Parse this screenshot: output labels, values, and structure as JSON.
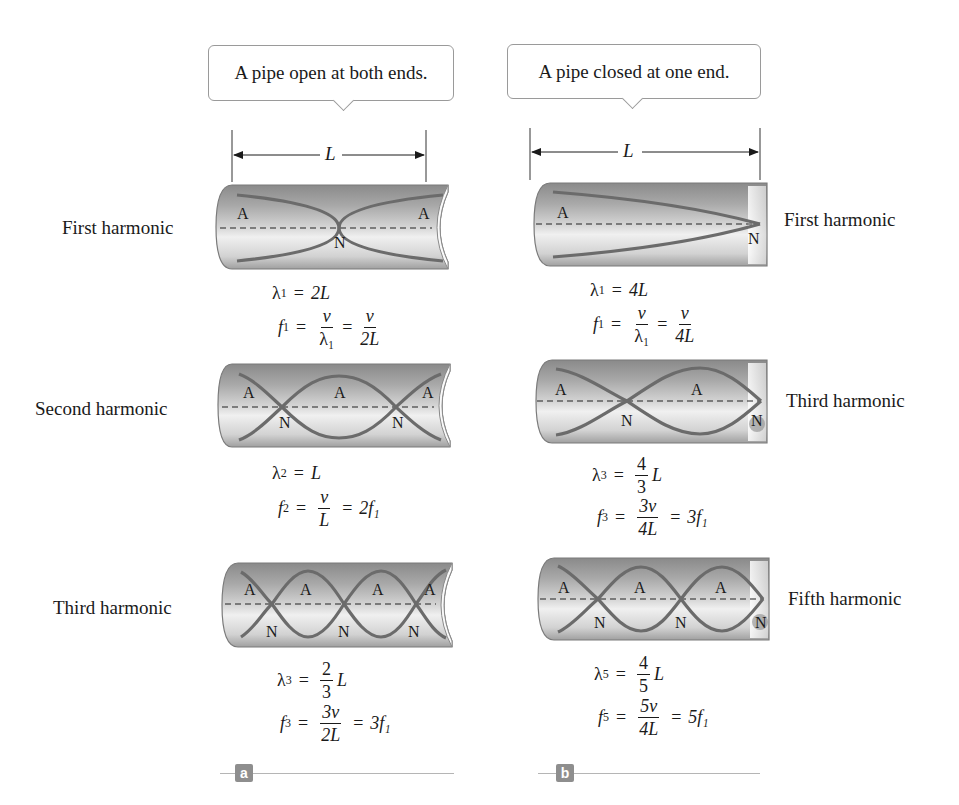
{
  "callouts": {
    "open": "A pipe open at both ends.",
    "closed": "A pipe closed at one end."
  },
  "dimension_label": "L",
  "panels": {
    "a": {
      "tag": "a",
      "rows": [
        {
          "label": "First harmonic",
          "antinode": "A",
          "node": "N",
          "wavelength": {
            "sym": "λ",
            "sub": "1",
            "rhs": "2L"
          },
          "frequency": {
            "sym": "f",
            "sub": "1",
            "mid_num": "v",
            "mid_den": "λ₁",
            "rhs_num": "v",
            "rhs_den": "2L"
          }
        },
        {
          "label": "Second harmonic",
          "antinode": "A",
          "node": "N",
          "wavelength": {
            "sym": "λ",
            "sub": "2",
            "rhs": "L"
          },
          "frequency": {
            "sym": "f",
            "sub": "2",
            "mid_num": "v",
            "mid_den": "L",
            "rhs": "2f₁"
          }
        },
        {
          "label": "Third harmonic",
          "antinode": "A",
          "node": "N",
          "wavelength": {
            "sym": "λ",
            "sub": "3",
            "frac_num": "2",
            "frac_den": "3",
            "rhs": "L"
          },
          "frequency": {
            "sym": "f",
            "sub": "3",
            "mid_num": "3v",
            "mid_den": "2L",
            "rhs": "3f₁"
          }
        }
      ]
    },
    "b": {
      "tag": "b",
      "rows": [
        {
          "label": "First harmonic",
          "antinode": "A",
          "node": "N",
          "wavelength": {
            "sym": "λ",
            "sub": "1",
            "rhs": "4L"
          },
          "frequency": {
            "sym": "f",
            "sub": "1",
            "mid_num": "v",
            "mid_den": "λ₁",
            "rhs_num": "v",
            "rhs_den": "4L"
          }
        },
        {
          "label": "Third harmonic",
          "antinode": "A",
          "node": "N",
          "wavelength": {
            "sym": "λ",
            "sub": "3",
            "frac_num": "4",
            "frac_den": "3",
            "rhs": "L"
          },
          "frequency": {
            "sym": "f",
            "sub": "3",
            "mid_num": "3v",
            "mid_den": "4L",
            "rhs": "3f₁"
          }
        },
        {
          "label": "Fifth harmonic",
          "antinode": "A",
          "node": "N",
          "wavelength": {
            "sym": "λ",
            "sub": "5",
            "frac_num": "4",
            "frac_den": "5",
            "rhs": "L"
          },
          "frequency": {
            "sym": "f",
            "sub": "5",
            "mid_num": "5v",
            "mid_den": "4L",
            "rhs": "5f₁"
          }
        }
      ]
    }
  },
  "colors": {
    "wave": "#6b6b6b",
    "pipe_dark": "#7d7d7d",
    "pipe_light": "#e6e6e6",
    "tag_bg": "#8e8e8e"
  }
}
